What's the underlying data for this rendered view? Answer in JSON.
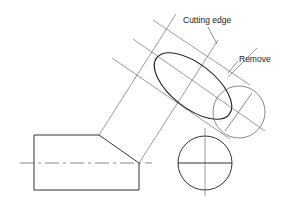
{
  "diagram": {
    "type": "technical-drawing",
    "labels": {
      "cutting_edge": "Cutting edge",
      "remove": "Remove"
    },
    "colors": {
      "line": "#333333",
      "thin_line": "#555555",
      "background": "#ffffff"
    }
  }
}
